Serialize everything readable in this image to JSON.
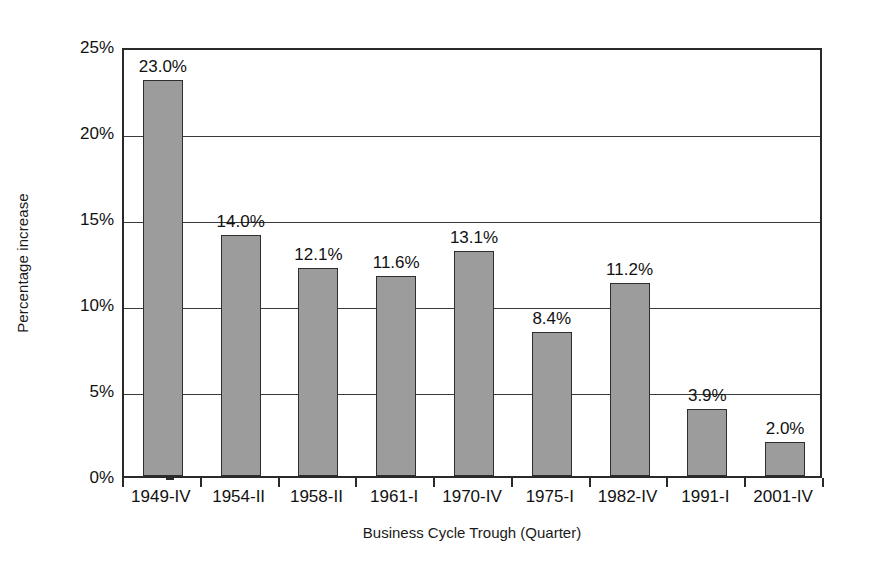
{
  "chart_data": {
    "type": "bar",
    "title": "",
    "xlabel": "Business Cycle Trough (Quarter)",
    "ylabel": "Percentage increase",
    "categories": [
      "1949-IV",
      "1954-II",
      "1958-II",
      "1961-I",
      "1970-IV",
      "1975-I",
      "1982-IV",
      "1991-I",
      "2001-IV"
    ],
    "values": [
      23.0,
      14.0,
      12.1,
      11.6,
      13.1,
      8.4,
      11.2,
      3.9,
      2.0
    ],
    "value_labels": [
      "23.0%",
      "14.0%",
      "12.1%",
      "11.6%",
      "13.1%",
      "8.4%",
      "11.2%",
      "3.9%",
      "2.0%"
    ],
    "ylim": [
      0,
      25
    ],
    "ytick_values": [
      0,
      5,
      10,
      15,
      20,
      25
    ],
    "ytick_labels": [
      "0%",
      "5%",
      "10%",
      "15%",
      "20%",
      "25%"
    ],
    "grid": "horizontal",
    "legend": "none",
    "bar_color": "#9c9c9c",
    "bar_edge_color": "#2e2e2e",
    "axis_color": "#2a2a2a",
    "background_color": "#ffffff"
  }
}
